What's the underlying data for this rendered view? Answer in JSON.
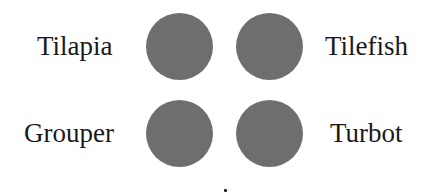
{
  "items": [
    {
      "label": "Tilapia",
      "position": "top-left"
    },
    {
      "label": "Tilefish",
      "position": "top-right"
    },
    {
      "label": "Grouper",
      "position": "bottom-left"
    },
    {
      "label": "Turbot",
      "position": "bottom-right"
    }
  ],
  "colors": {
    "circle": "#6e6e6e",
    "text": "#1a1a1a",
    "background": "#ffffff"
  }
}
